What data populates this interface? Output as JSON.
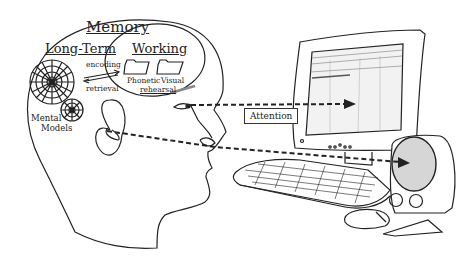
{
  "diagram": {
    "memory_label": "Memory",
    "long_term_label": "Long-Term",
    "working_label": "Working",
    "encoding_label": "encoding",
    "retrieval_label": "retrieval",
    "phonetic_label": "Phonetic",
    "visual_label": "Visual",
    "rehearsal_label": "rehearsal",
    "mental_label": "Mental",
    "models_label": "Models",
    "attention_label": "Attention"
  },
  "icons": [
    "head-profile",
    "web-network-icon",
    "small-web-icon",
    "folder-icon",
    "eye-icon",
    "ear-icon",
    "monitor-icon",
    "keyboard-icon",
    "speaker-icon",
    "mouse-icon"
  ],
  "colors": {
    "line": "#222222",
    "speaker_cone": "#d6d6d6",
    "screen": "#f2f2f2"
  }
}
